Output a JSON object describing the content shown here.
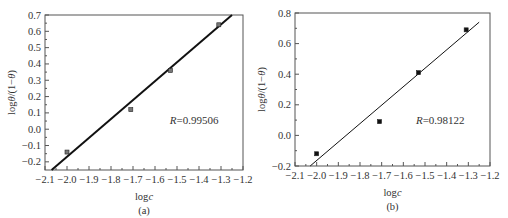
{
  "chart_data": [
    {
      "id": "a",
      "type": "scatter",
      "title": "",
      "caption": "(a)",
      "xlabel": "logc",
      "ylabel": "logθ/(1−θ)",
      "xlim": [
        -2.1,
        -1.2
      ],
      "ylim": [
        -0.25,
        0.7
      ],
      "xticks": [
        "-2.1",
        "-2.0",
        "-1.9",
        "-1.8",
        "-1.7",
        "-1.6",
        "-1.5",
        "-1.4",
        "-1.3",
        "-1.2"
      ],
      "yticks": [
        "-0.2",
        "-0.1",
        "0.0",
        "0.1",
        "0.2",
        "0.3",
        "0.4",
        "0.5",
        "0.6",
        "0.7"
      ],
      "grid": false,
      "series": [
        {
          "name": "data",
          "marker": "square",
          "x": [
            -2.0,
            -1.71,
            -1.53,
            -1.31
          ],
          "y": [
            -0.14,
            0.12,
            0.36,
            0.64
          ]
        },
        {
          "name": "linear fit",
          "style": "line",
          "x": [
            -2.07,
            -1.25
          ],
          "y": [
            -0.25,
            0.7
          ]
        }
      ],
      "annotation": "R=0.99506"
    },
    {
      "id": "b",
      "type": "scatter",
      "title": "",
      "caption": "(b)",
      "xlabel": "logc",
      "ylabel": "logθ/(1−θ)",
      "xlim": [
        -2.1,
        -1.2
      ],
      "ylim": [
        -0.2,
        0.8
      ],
      "xticks": [
        "-2.1",
        "-2.0",
        "-1.9",
        "-1.8",
        "-1.7",
        "-1.6",
        "-1.5",
        "-1.4",
        "-1.3",
        "-1.2"
      ],
      "yticks": [
        "-0.2",
        "0.0",
        "0.2",
        "0.4",
        "0.6",
        "0.8"
      ],
      "grid": false,
      "series": [
        {
          "name": "data",
          "marker": "square",
          "x": [
            -2.0,
            -1.71,
            -1.53,
            -1.31
          ],
          "y": [
            -0.12,
            0.09,
            0.41,
            0.69
          ]
        },
        {
          "name": "linear fit",
          "style": "line",
          "x": [
            -2.03,
            -1.25
          ],
          "y": [
            -0.2,
            0.74
          ]
        }
      ],
      "annotation": "R=0.98122"
    }
  ],
  "charts": {
    "a": {
      "caption": "(a)",
      "xlabel": "logc",
      "ylabel": "logθ/(1−θ)",
      "r_prefix": "R",
      "r_value": "=0.99506"
    },
    "b": {
      "caption": "(b)",
      "xlabel": "logc",
      "ylabel": "logθ/(1−θ)",
      "r_prefix": "R",
      "r_value": "=0.98122"
    }
  }
}
